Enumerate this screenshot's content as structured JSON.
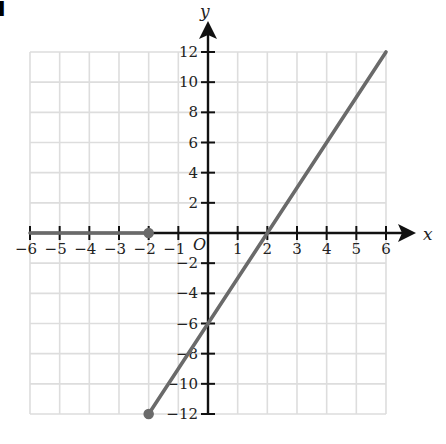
{
  "part_label": "i",
  "chart_data": {
    "type": "line",
    "title": "",
    "xlabel": "x",
    "ylabel": "y",
    "xlim": [
      -6,
      6
    ],
    "ylim": [
      -12,
      12
    ],
    "grid": true,
    "origin_label": "O",
    "x_ticks": [
      -6,
      -5,
      -4,
      -3,
      -2,
      -1,
      1,
      2,
      3,
      4,
      5,
      6
    ],
    "x_tick_labels": [
      "−6",
      "−5",
      "−4",
      "−3",
      "−2",
      "−1",
      "1",
      "2",
      "3",
      "4",
      "5",
      "6"
    ],
    "y_ticks": [
      -12,
      -10,
      -8,
      -6,
      -4,
      -2,
      2,
      4,
      6,
      8,
      10,
      12
    ],
    "y_tick_labels": [
      "−12",
      "−10",
      "−8",
      "−6",
      "−4",
      "−2",
      "2",
      "4",
      "6",
      "8",
      "10",
      "12"
    ],
    "series": [
      {
        "name": "segment-1",
        "description": "horizontal segment y = 0 for -6 ≤ x ≤ -2",
        "points": [
          [
            -6,
            0
          ],
          [
            -2,
            0
          ]
        ],
        "endpoints": [
          {
            "x": -2,
            "y": 0,
            "closed": true
          }
        ]
      },
      {
        "name": "segment-2",
        "description": "line y = 3x - 6 for -2 ≤ x ≤ 6",
        "points": [
          [
            -2,
            -12
          ],
          [
            0,
            -6
          ],
          [
            2,
            0
          ],
          [
            6,
            12
          ]
        ],
        "endpoints": [
          {
            "x": -2,
            "y": -12,
            "closed": true
          }
        ]
      }
    ],
    "colors": {
      "grid": "#dddddd",
      "axis": "#111111",
      "line": "#6a6a6a"
    }
  }
}
